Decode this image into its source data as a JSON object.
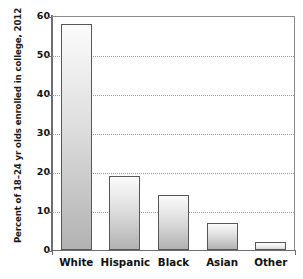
{
  "chart_data": {
    "type": "bar",
    "title": "",
    "subtitle": "",
    "xlabel": "",
    "ylabel": "Percent of 18–24 yr olds enrolled in college, 2012",
    "categories": [
      "White",
      "Hispanic",
      "Black",
      "Asian",
      "Other"
    ],
    "values": [
      58,
      19,
      14,
      7,
      2
    ],
    "ylim": [
      0,
      60
    ],
    "yticks": [
      0,
      10,
      20,
      30,
      40,
      50,
      60
    ],
    "ytick_labels": [
      "0",
      "10",
      "20",
      "30",
      "40",
      "50",
      "60"
    ],
    "grid": "horizontal-dotted",
    "legend": "none",
    "series": [
      {
        "name": "Percent enrolled in college",
        "values": [
          58,
          19,
          14,
          7,
          2
        ]
      }
    ],
    "annotations": []
  },
  "style": {
    "bar_outline_color": "#58585a",
    "bar_fill_top": "#fbfbfb",
    "bar_fill_bottom": "#b2b2b2",
    "axis_color": "#6e6e6e",
    "grid_color": "#9a9a9a",
    "text_color": "#111111",
    "background": "#ffffff"
  }
}
